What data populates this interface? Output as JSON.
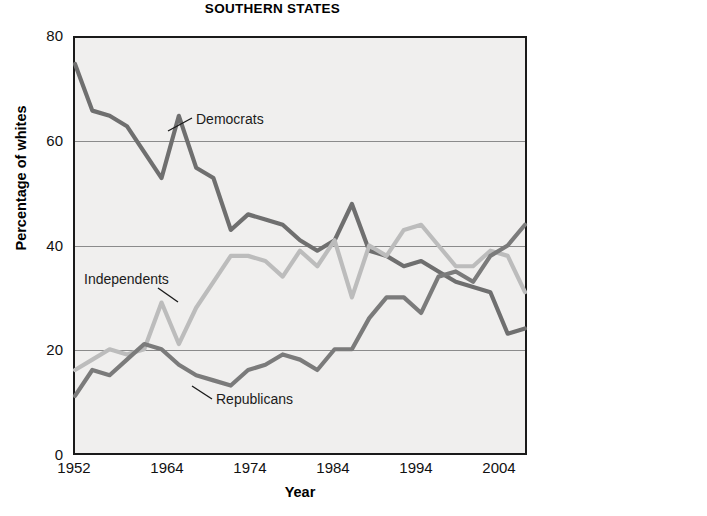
{
  "figure": {
    "panels": [
      {
        "id": "southern-states",
        "title": "SOUTHERN STATES",
        "xlabel": "Year",
        "ylabel": "Percentage of whites"
      },
      {
        "id": "right-panel-cropped",
        "title": "",
        "xlabel": "",
        "ylabel": "Percentage of whites"
      }
    ]
  },
  "colors": {
    "democrats": "#6f6f6f",
    "independents": "#bcbcbc",
    "republicans": "#7b7b7b",
    "grid": "#8b8b8b",
    "frame": "#1a1a1a",
    "plot_background": "#f0efee",
    "text": "#111111"
  },
  "chart_data": [
    {
      "type": "line",
      "title": "SOUTHERN STATES",
      "xlabel": "Year",
      "ylabel": "Percentage of whites",
      "xlim": [
        1952,
        2004
      ],
      "ylim": [
        0,
        80
      ],
      "yticks": [
        0,
        20,
        40,
        60,
        80
      ],
      "xticks": [
        1952,
        1964,
        1974,
        1984,
        1994,
        2004
      ],
      "grid": "horizontal",
      "legend": "inline-annotations",
      "x": [
        1952,
        1954,
        1956,
        1958,
        1960,
        1962,
        1964,
        1966,
        1968,
        1970,
        1972,
        1974,
        1976,
        1978,
        1980,
        1982,
        1984,
        1986,
        1988,
        1990,
        1992,
        1994,
        1996,
        1998,
        2000,
        2002,
        2004
      ],
      "series": [
        {
          "name": "Democrats",
          "color": "#6f6f6f",
          "label_x": 1968,
          "label_y": 64,
          "values": [
            75,
            66,
            65,
            63,
            58,
            53,
            65,
            55,
            53,
            43,
            46,
            45,
            44,
            41,
            39,
            41,
            48,
            39,
            38,
            36,
            37,
            35,
            33,
            32,
            31,
            23,
            24
          ]
        },
        {
          "name": "Independents",
          "color": "#bcbcbc",
          "label_x": 1958,
          "label_y": 31,
          "values": [
            16,
            18,
            20,
            19,
            20,
            29,
            21,
            28,
            33,
            38,
            38,
            37,
            34,
            39,
            36,
            41,
            30,
            40,
            38,
            43,
            44,
            40,
            36,
            36,
            39,
            38,
            31
          ]
        },
        {
          "name": "Republicans",
          "color": "#7b7b7b",
          "label_x": 1977,
          "label_y": 14,
          "values": [
            11,
            16,
            15,
            18,
            21,
            20,
            17,
            15,
            14,
            13,
            16,
            17,
            19,
            18,
            16,
            20,
            20,
            26,
            30,
            30,
            27,
            34,
            35,
            33,
            38,
            40,
            44
          ]
        }
      ]
    },
    {
      "type": "line",
      "title": "",
      "xlabel": "",
      "ylabel": "Percentage of whites",
      "xlim": [
        1952,
        1964
      ],
      "ylim": [
        0,
        80
      ],
      "yticks": [
        0,
        20,
        40,
        60,
        80
      ],
      "xticks": [
        1952
      ],
      "grid": "horizontal",
      "cropped": true,
      "x": [
        1952,
        1954,
        1956,
        1958,
        1960
      ],
      "series": [
        {
          "name": "series-dark",
          "color": "#6f6f6f",
          "values": [
            40,
            32,
            38,
            43,
            40
          ]
        },
        {
          "name": "series-mid",
          "color": "#7b7b7b",
          "values": [
            33,
            35,
            34,
            34,
            35
          ]
        },
        {
          "name": "series-light",
          "color": "#bcbcbc",
          "values": [
            27,
            30,
            22,
            24,
            24
          ]
        }
      ]
    }
  ]
}
